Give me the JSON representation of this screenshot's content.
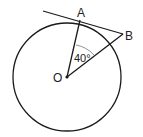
{
  "diagram": {
    "type": "circle-tangent-geometry",
    "labels": {
      "center": "O",
      "tangent_point": "A",
      "external_point": "B",
      "angle": "40°"
    },
    "angle_AOB_degrees": 40,
    "colors": {
      "stroke": "#1a1a1a",
      "background": "#ffffff"
    }
  }
}
